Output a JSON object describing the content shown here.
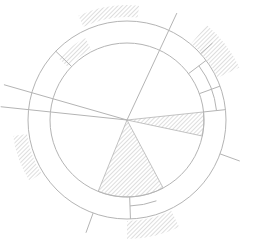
{
  "diagram": {
    "type": "radial-line-drawing",
    "width": 258,
    "height": 241,
    "center": [
      127,
      120
    ],
    "inner_radius": 77,
    "outer_radius": 99,
    "colors": {
      "background": "#ffffff",
      "stroke": "#b4b4b4",
      "hatch": "#bdbdbd"
    },
    "hatched_wedges": [
      {
        "name": "center-wedge-right",
        "r0": 0,
        "r1": 77,
        "a0": -6,
        "a1": 12
      },
      {
        "name": "center-wedge-bottom",
        "r0": 0,
        "r1": 77,
        "a0": 62,
        "a1": 112
      },
      {
        "name": "band-wedge-upper-left",
        "r0": 79,
        "r1": 92,
        "a0": 222,
        "a1": 243
      },
      {
        "name": "outer-wedge-top",
        "r0": 103,
        "r1": 115,
        "a0": 245,
        "a1": 276
      },
      {
        "name": "outer-wedge-right",
        "r0": 100,
        "r1": 124,
        "a0": 310,
        "a1": 335
      },
      {
        "name": "outer-wedge-left",
        "r0": 101,
        "r1": 115,
        "a0": 148,
        "a1": 172
      },
      {
        "name": "outer-wedge-bottom",
        "r0": 101,
        "r1": 119,
        "a0": 64,
        "a1": 90
      }
    ],
    "radial_lines": [
      {
        "name": "ray-upper-right",
        "r0": 0,
        "r1": 118,
        "a": -65
      },
      {
        "name": "ray-left-upper",
        "r0": 0,
        "r1": 128,
        "a": 196
      },
      {
        "name": "ray-left",
        "r0": 0,
        "r1": 127,
        "a": 186
      },
      {
        "name": "tick-right",
        "r0": 99,
        "r1": 120,
        "a": 20
      },
      {
        "name": "tick-bottom-left",
        "r0": 99,
        "r1": 120,
        "a": 110
      },
      {
        "name": "tick-upper-right",
        "r0": 99,
        "r1": 115,
        "a": 318
      },
      {
        "name": "seg-band-ul",
        "r0": 77,
        "r1": 99,
        "a": 224
      },
      {
        "name": "seg-band-ur1",
        "r0": 77,
        "r1": 99,
        "a": 323
      },
      {
        "name": "seg-band-ur2",
        "r0": 77,
        "r1": 99,
        "a": 340
      },
      {
        "name": "seg-band-r",
        "r0": 77,
        "r1": 99,
        "a": 354
      },
      {
        "name": "seg-band-b",
        "r0": 77,
        "r1": 99,
        "a": 88
      }
    ],
    "arc_segments": [
      {
        "name": "mid-arc-upper-right",
        "r": 90,
        "a0": 323,
        "a1": 354
      },
      {
        "name": "mid-arc-bottom",
        "r": 86,
        "a0": 70,
        "a1": 88
      }
    ]
  }
}
